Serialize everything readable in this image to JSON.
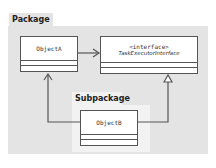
{
  "diagram": {
    "type": "uml-class-diagram",
    "package": {
      "label": "Package"
    },
    "subpackage": {
      "label": "Subpackage"
    },
    "classes": [
      {
        "id": "objecta",
        "name": "ObjectA"
      },
      {
        "id": "interface",
        "stereotype": "<interface>",
        "name": "TaskExecutorInterface"
      },
      {
        "id": "objectb",
        "name": "ObjectB"
      }
    ],
    "relations": [
      {
        "from": "ObjectA",
        "to": "TaskExecutorInterface",
        "kind": "dependency/association (open arrow)"
      },
      {
        "from": "ObjectB",
        "to": "ObjectA",
        "kind": "association (open arrow)"
      },
      {
        "from": "ObjectB",
        "to": "TaskExecutorInterface",
        "kind": "realization (hollow triangle)"
      }
    ],
    "colors": {
      "package_fill": "#e4e4e4",
      "subpackage_fill": "#f2f2f2",
      "box_fill": "#ffffff",
      "stroke": "#555555"
    }
  }
}
